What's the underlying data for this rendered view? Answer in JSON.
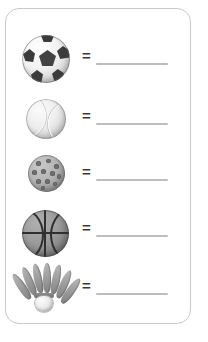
{
  "worksheet": {
    "border_color": "#c9c9c9",
    "background_color": "#ffffff",
    "equals_symbol": "=",
    "line_color": "#bdbdbd",
    "rows": [
      {
        "id": "row-soccer-ball",
        "figure_name": "soccer-ball",
        "figure_label": "Soccer ball",
        "equals": "=",
        "answer_value": "",
        "answer_placeholder": ""
      },
      {
        "id": "row-tennis-ball",
        "figure_name": "tennis-ball",
        "figure_label": "Tennis ball",
        "equals": "=",
        "answer_value": "",
        "answer_placeholder": ""
      },
      {
        "id": "row-dimpled-ball",
        "figure_name": "dimpled-practice-ball",
        "figure_label": "Dimpled practice ball",
        "equals": "=",
        "answer_value": "",
        "answer_placeholder": ""
      },
      {
        "id": "row-basketball",
        "figure_name": "basketball",
        "figure_label": "Basketball",
        "equals": "=",
        "answer_value": "",
        "answer_placeholder": ""
      },
      {
        "id": "row-shuttlecock",
        "figure_name": "badminton-shuttlecock",
        "figure_label": "Badminton shuttlecock",
        "equals": "=",
        "answer_value": "",
        "answer_placeholder": ""
      }
    ]
  }
}
